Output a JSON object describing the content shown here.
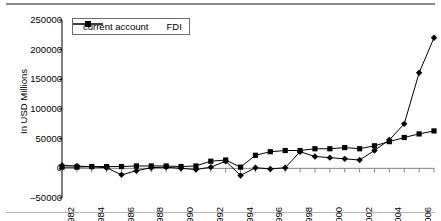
{
  "chart_data": {
    "type": "line",
    "title": "",
    "xlabel": "",
    "ylabel": "In USD Millions",
    "ylim": [
      -50000,
      250000
    ],
    "ytick_labels": [
      "250000",
      "200000",
      "150000",
      "100000",
      "50000",
      "0",
      "-50000"
    ],
    "ytick_values": [
      250000,
      200000,
      150000,
      100000,
      50000,
      0,
      -50000
    ],
    "xlim": [
      1982,
      2007
    ],
    "x": [
      1982,
      1983,
      1984,
      1985,
      1986,
      1987,
      1988,
      1989,
      1990,
      1991,
      1992,
      1993,
      1994,
      1995,
      1996,
      1997,
      1998,
      1999,
      2000,
      2001,
      2002,
      2003,
      2004,
      2005,
      2006,
      2007
    ],
    "xtick_labels": [
      "1982",
      "1984",
      "1986",
      "1988",
      "1990",
      "1992",
      "1994",
      "1996",
      "1998",
      "2000",
      "2002",
      "2004",
      "2006"
    ],
    "xtick_values": [
      1982,
      1984,
      1986,
      1988,
      1990,
      1992,
      1994,
      1996,
      1998,
      2000,
      2002,
      2004,
      2006
    ],
    "grid": false,
    "legend_position": "top-left",
    "series": [
      {
        "name": "current account",
        "marker": "diamond",
        "color": "#000000",
        "values": [
          5000,
          4000,
          2500,
          1000,
          -11000,
          -4000,
          1000,
          2000,
          0,
          -2000,
          2000,
          12000,
          -12000,
          1000,
          -1000,
          1000,
          28000,
          20000,
          18000,
          16000,
          14000,
          30000,
          48000,
          75000,
          161000,
          220000
        ]
      },
      {
        "name": "FDI",
        "marker": "square",
        "color": "#000000",
        "values": [
          2000,
          2000,
          3000,
          3000,
          3000,
          4000,
          4000,
          4000,
          3000,
          4000,
          12000,
          14000,
          2000,
          22000,
          28000,
          30000,
          30000,
          33000,
          33000,
          35000,
          33000,
          38000,
          45000,
          52000,
          58000,
          63000
        ]
      }
    ]
  },
  "legend": {
    "items": [
      {
        "label": "current account"
      },
      {
        "label": "FDI"
      }
    ]
  }
}
